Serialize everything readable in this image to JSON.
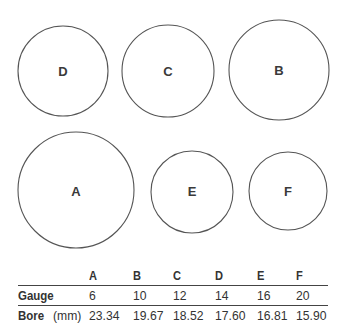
{
  "circles": [
    {
      "id": "D",
      "cx": 63,
      "cy": 71,
      "r": 45
    },
    {
      "id": "C",
      "cx": 168,
      "cy": 71,
      "r": 46
    },
    {
      "id": "B",
      "cx": 279,
      "cy": 70,
      "r": 50
    },
    {
      "id": "A",
      "cx": 76,
      "cy": 190,
      "r": 58
    },
    {
      "id": "E",
      "cx": 192,
      "cy": 192,
      "r": 41
    },
    {
      "id": "F",
      "cx": 288,
      "cy": 191,
      "r": 39
    }
  ],
  "table": {
    "columns": [
      "A",
      "B",
      "C",
      "D",
      "E",
      "F"
    ],
    "gauge_label": "Gauge",
    "bore_label_bold": "Bore",
    "bore_label_unit": "(mm)",
    "gauge": [
      "6",
      "10",
      "12",
      "14",
      "16",
      "20"
    ],
    "bore": [
      "23.34",
      "19.67",
      "18.52",
      "17.60",
      "16.81",
      "15.90"
    ]
  }
}
